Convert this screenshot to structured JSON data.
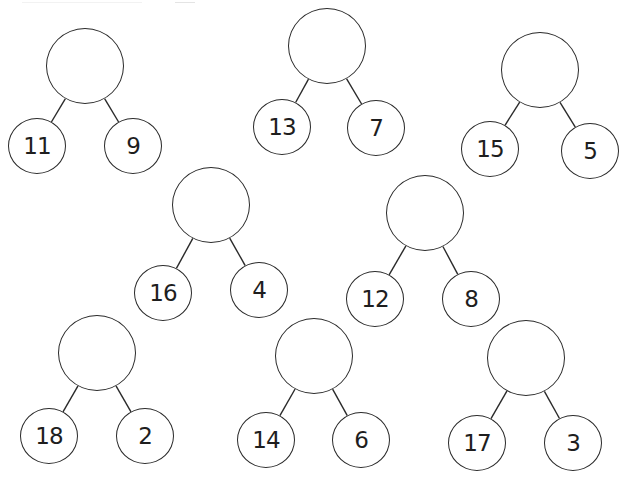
{
  "worksheet": {
    "type": "number bond / part-part-whole",
    "instruction_visible": false,
    "colors": {
      "stroke": "#2a2a2a",
      "text": "#1e1e1e",
      "background": "#ffffff"
    },
    "bonds": [
      {
        "whole": "",
        "left": "11",
        "right": "9",
        "top": {
          "cx": 85,
          "cy": 66
        },
        "leftNode": {
          "cx": 37,
          "cy": 146
        },
        "rightNode": {
          "cx": 133,
          "cy": 146
        }
      },
      {
        "whole": "",
        "left": "13",
        "right": "7",
        "top": {
          "cx": 327,
          "cy": 46
        },
        "leftNode": {
          "cx": 282,
          "cy": 127
        },
        "rightNode": {
          "cx": 376,
          "cy": 128
        }
      },
      {
        "whole": "",
        "left": "15",
        "right": "5",
        "top": {
          "cx": 540,
          "cy": 70
        },
        "leftNode": {
          "cx": 490,
          "cy": 149
        },
        "rightNode": {
          "cx": 590,
          "cy": 151
        }
      },
      {
        "whole": "",
        "left": "16",
        "right": "4",
        "top": {
          "cx": 211,
          "cy": 205
        },
        "leftNode": {
          "cx": 163,
          "cy": 293
        },
        "rightNode": {
          "cx": 259,
          "cy": 290
        }
      },
      {
        "whole": "",
        "left": "12",
        "right": "8",
        "top": {
          "cx": 425,
          "cy": 213
        },
        "leftNode": {
          "cx": 375,
          "cy": 299
        },
        "rightNode": {
          "cx": 471,
          "cy": 299
        }
      },
      {
        "whole": "",
        "left": "18",
        "right": "2",
        "top": {
          "cx": 97,
          "cy": 353
        },
        "leftNode": {
          "cx": 49,
          "cy": 436
        },
        "rightNode": {
          "cx": 145,
          "cy": 436
        }
      },
      {
        "whole": "",
        "left": "14",
        "right": "6",
        "top": {
          "cx": 314,
          "cy": 356
        },
        "leftNode": {
          "cx": 266,
          "cy": 440
        },
        "rightNode": {
          "cx": 361,
          "cy": 440
        }
      },
      {
        "whole": "",
        "left": "17",
        "right": "3",
        "top": {
          "cx": 526,
          "cy": 358
        },
        "leftNode": {
          "cx": 477,
          "cy": 443
        },
        "rightNode": {
          "cx": 573,
          "cy": 443
        }
      }
    ]
  }
}
